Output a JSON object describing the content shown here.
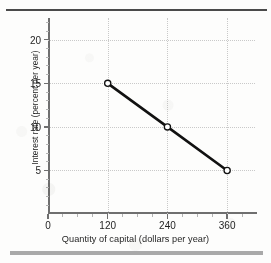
{
  "figure": {
    "background_color": "#fdfdfc",
    "top_rule_color": "#4a4a4a",
    "bottom_bar_color": "#a9a9a9"
  },
  "chart_data": {
    "type": "line",
    "title": "",
    "subtitle": "",
    "xlabel": "Quantity of capital (dollars per year)",
    "ylabel": "Interest rate (percent per year)",
    "xlim": [
      0,
      420
    ],
    "ylim": [
      0,
      22.5
    ],
    "x_ticks": [
      0,
      120,
      240,
      360
    ],
    "x_ticklabels": [
      "0",
      "120",
      "240",
      "360"
    ],
    "y_ticks": [
      5,
      10,
      15,
      20
    ],
    "y_ticklabels": [
      "5",
      "10",
      "15",
      "20"
    ],
    "grid": true,
    "grid_style": "dotted",
    "grid_color": "#c9c9c9",
    "legend": false,
    "legend_position": "none",
    "series": [
      {
        "name": "Demand for capital",
        "color": "#111111",
        "line_width": 2.6,
        "marker": "open-circle",
        "marker_face_color": "#ffffff",
        "marker_edge_color": "#111111",
        "x": [
          120,
          240,
          360
        ],
        "y": [
          15,
          10,
          5
        ],
        "points": [
          {
            "x": 120,
            "y": 15
          },
          {
            "x": 240,
            "y": 10
          },
          {
            "x": 360,
            "y": 5
          }
        ]
      }
    ],
    "annotations": []
  }
}
